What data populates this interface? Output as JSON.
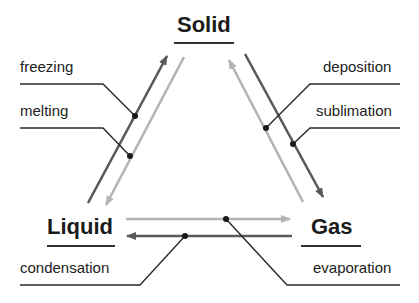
{
  "states": {
    "solid": "Solid",
    "liquid": "Liquid",
    "gas": "Gas"
  },
  "transitions": {
    "freezing": {
      "label": "freezing",
      "from": "Liquid",
      "to": "Solid",
      "line": "dark"
    },
    "melting": {
      "label": "melting",
      "from": "Solid",
      "to": "Liquid",
      "line": "light"
    },
    "deposition": {
      "label": "deposition",
      "from": "Gas",
      "to": "Solid",
      "line": "light"
    },
    "sublimation": {
      "label": "sublimation",
      "from": "Solid",
      "to": "Gas",
      "line": "dark"
    },
    "condensation": {
      "label": "condensation",
      "from": "Gas",
      "to": "Liquid",
      "line": "dark"
    },
    "evaporation": {
      "label": "evaporation",
      "from": "Liquid",
      "to": "Gas",
      "line": "light"
    }
  },
  "colors": {
    "dark_arrow": "#5a5a5a",
    "light_arrow": "#b4b4b4",
    "leader": "#2a2a2a",
    "text": "#1b1b1b"
  }
}
